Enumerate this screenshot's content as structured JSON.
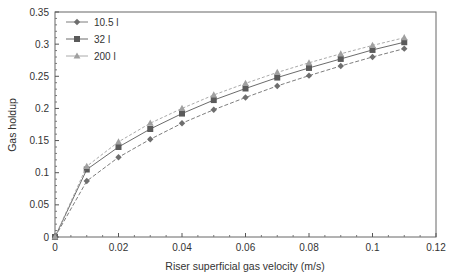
{
  "chart_data": {
    "type": "line",
    "title": "",
    "xlabel": "Riser superficial gas velocity (m/s)",
    "ylabel": "Gas holdup",
    "xlim": [
      0,
      0.12
    ],
    "ylim": [
      0,
      0.35
    ],
    "x_ticks": [
      "0",
      "0.02",
      "0.04",
      "0.06",
      "0.08",
      "0.1",
      "0.12"
    ],
    "y_ticks": [
      "0",
      "0.05",
      "0.1",
      "0.15",
      "0.2",
      "0.25",
      "0.3",
      "0.35"
    ],
    "grid": false,
    "legend_position": "upper-left",
    "x": [
      0,
      0.01,
      0.02,
      0.03,
      0.04,
      0.05,
      0.06,
      0.07,
      0.08,
      0.09,
      0.1,
      0.11
    ],
    "series": [
      {
        "name": "10.5 l",
        "marker": "diamond",
        "values": [
          0,
          0.087,
          0.124,
          0.152,
          0.177,
          0.198,
          0.217,
          0.235,
          0.251,
          0.266,
          0.28,
          0.293
        ]
      },
      {
        "name": "32 l",
        "marker": "square",
        "values": [
          0,
          0.105,
          0.14,
          0.168,
          0.192,
          0.213,
          0.231,
          0.248,
          0.263,
          0.277,
          0.291,
          0.303
        ]
      },
      {
        "name": "200 l",
        "marker": "triangle",
        "values": [
          0,
          0.11,
          0.148,
          0.177,
          0.2,
          0.221,
          0.239,
          0.256,
          0.271,
          0.285,
          0.298,
          0.31
        ]
      }
    ]
  },
  "colors": {
    "series_10_5": "#777777",
    "series_32": "#666666",
    "series_200": "#999999",
    "axis": "#555555"
  }
}
